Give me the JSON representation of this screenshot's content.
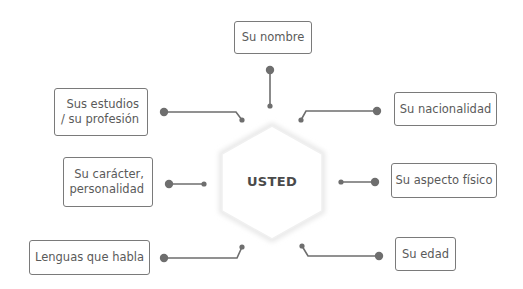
{
  "diagram": {
    "center": {
      "label": "USTED"
    },
    "nodes": [
      {
        "id": "nombre",
        "label": "Su nombre"
      },
      {
        "id": "estudios",
        "label": "Sus estudios / su profesión"
      },
      {
        "id": "nacionalidad",
        "label": "Su nacionalidad"
      },
      {
        "id": "caracter",
        "label": "Su carácter, personalidad"
      },
      {
        "id": "aspecto",
        "label": "Su aspecto físico"
      },
      {
        "id": "lenguas",
        "label": "Lenguas que habla"
      },
      {
        "id": "edad",
        "label": "Su edad"
      }
    ],
    "colors": {
      "line": "#6e6e6e",
      "border": "#7a7a7a",
      "text": "#5a5a5a",
      "hexagon_shadow": "#e8e8e8"
    }
  }
}
